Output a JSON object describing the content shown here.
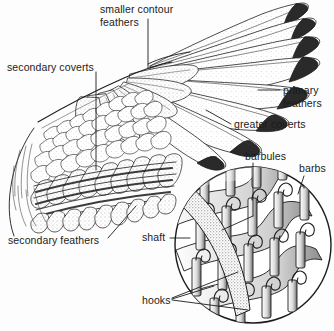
{
  "figure": {
    "background_color": "#fdfdfd",
    "ink_color": "#1b1b1b",
    "width": 334,
    "height": 331
  },
  "labels": {
    "smaller_contour_feathers_line1": "smaller contour",
    "smaller_contour_feathers_line2": "feathers",
    "secondary_coverts": "secondary coverts",
    "primary_feathers_line1": "primary",
    "primary_feathers_line2": "feathers",
    "greater_coverts": "greater coverts",
    "secondary_feathers": "secondary feathers",
    "barbules": "barbules",
    "barbs": "barbs",
    "shaft": "shaft",
    "hooks": "hooks"
  },
  "diagram_parts": [
    {
      "name": "smaller-contour-feathers",
      "label": "smaller contour feathers",
      "leader": "vertical"
    },
    {
      "name": "secondary-coverts",
      "label": "secondary coverts",
      "leader": "vertical"
    },
    {
      "name": "primary-feathers",
      "label": "primary feathers",
      "leader": "horizontal"
    },
    {
      "name": "greater-coverts",
      "label": "greater coverts",
      "leader": "diagonal"
    },
    {
      "name": "secondary-feathers",
      "label": "secondary feathers",
      "leader": "diagonal"
    },
    {
      "name": "barbules",
      "label": "barbules",
      "leader": "vertical"
    },
    {
      "name": "barbs",
      "label": "barbs",
      "leader": "diagonal"
    },
    {
      "name": "shaft",
      "label": "shaft",
      "leader": "horizontal"
    },
    {
      "name": "hooks",
      "label": "hooks",
      "leader": "diagonal-fan"
    }
  ]
}
